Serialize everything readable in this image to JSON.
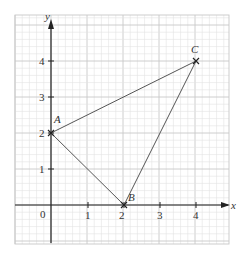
{
  "chart_data": {
    "type": "scatter",
    "title": "",
    "xlabel": "x",
    "ylabel": "y",
    "xlim": [
      -1,
      4.9
    ],
    "ylim": [
      -1.1,
      5.1
    ],
    "grid": true,
    "minor_grid_step": 0.2,
    "x_ticks": [
      "0",
      "1",
      "2",
      "3",
      "4"
    ],
    "y_ticks": [
      "1",
      "2",
      "3",
      "4"
    ],
    "points": [
      {
        "label": "A",
        "x": 0,
        "y": 2
      },
      {
        "label": "B",
        "x": 2,
        "y": 0
      },
      {
        "label": "C",
        "x": 4,
        "y": 4
      }
    ],
    "segments": [
      [
        "A",
        "C"
      ],
      [
        "A",
        "B"
      ],
      [
        "B",
        "C"
      ]
    ],
    "origin_label": "0"
  },
  "axes": {
    "x_label": "x",
    "y_label": "y",
    "origin": "0",
    "x_tick_labels": [
      "1",
      "2",
      "3",
      "4"
    ],
    "y_tick_labels": [
      "1",
      "2",
      "3",
      "4"
    ]
  },
  "points": {
    "A": "A",
    "B": "B",
    "C": "C"
  },
  "colors": {
    "grid_major": "#c8c8c8",
    "grid_minor": "#e2e2e2",
    "axis": "#222222",
    "line": "#555555"
  }
}
